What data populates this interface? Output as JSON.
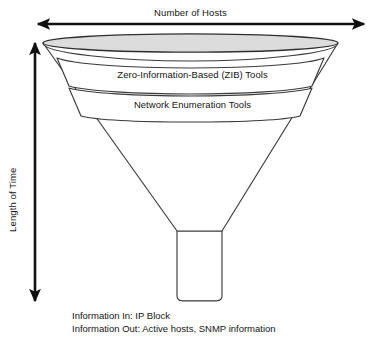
{
  "figure": {
    "kind": "funnel-diagram",
    "background_color": "#ffffff",
    "stroke_color": "#3a3a3a",
    "arrow_color": "#111111",
    "ellipse_fill": "#dcdcdc",
    "band_fill": "#ffffff",
    "text_color": "#141414"
  },
  "axes": {
    "horizontal": {
      "label": "Number of Hosts",
      "arrow_style": "double-headed",
      "orientation": "horizontal"
    },
    "vertical": {
      "label": "Length of Time",
      "arrow_style": "double-headed",
      "orientation": "vertical"
    }
  },
  "funnel": {
    "bands": [
      {
        "id": "zib",
        "label": "Zero-Information-Based (ZIB) Tools"
      },
      {
        "id": "enumeration",
        "label": "Network Enumeration Tools"
      }
    ]
  },
  "caption": {
    "lines": [
      "Information In: IP Block",
      "Information Out: Active hosts, SNMP information"
    ],
    "line_1": "Information In: IP Block",
    "line_2": "Information Out: Active hosts, SNMP information"
  }
}
